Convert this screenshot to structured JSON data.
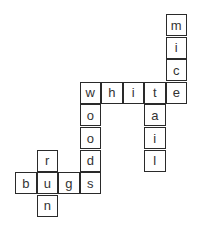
{
  "puzzle": {
    "type": "crossword",
    "words": [
      "mice",
      "white",
      "tail",
      "woods",
      "bugs",
      "run"
    ],
    "cells": [
      {
        "r": 0,
        "c": 7,
        "letter": "m"
      },
      {
        "r": 1,
        "c": 7,
        "letter": "i"
      },
      {
        "r": 2,
        "c": 7,
        "letter": "c"
      },
      {
        "r": 3,
        "c": 3,
        "letter": "w"
      },
      {
        "r": 3,
        "c": 4,
        "letter": "h"
      },
      {
        "r": 3,
        "c": 5,
        "letter": "i"
      },
      {
        "r": 3,
        "c": 6,
        "letter": "t"
      },
      {
        "r": 3,
        "c": 7,
        "letter": "e"
      },
      {
        "r": 4,
        "c": 3,
        "letter": "o"
      },
      {
        "r": 4,
        "c": 6,
        "letter": "a"
      },
      {
        "r": 5,
        "c": 3,
        "letter": "o"
      },
      {
        "r": 5,
        "c": 6,
        "letter": "i"
      },
      {
        "r": 6,
        "c": 1,
        "letter": "r"
      },
      {
        "r": 6,
        "c": 3,
        "letter": "d"
      },
      {
        "r": 6,
        "c": 6,
        "letter": "l"
      },
      {
        "r": 7,
        "c": 0,
        "letter": "b"
      },
      {
        "r": 7,
        "c": 1,
        "letter": "u"
      },
      {
        "r": 7,
        "c": 2,
        "letter": "g"
      },
      {
        "r": 7,
        "c": 3,
        "letter": "s"
      },
      {
        "r": 8,
        "c": 1,
        "letter": "n"
      }
    ]
  }
}
